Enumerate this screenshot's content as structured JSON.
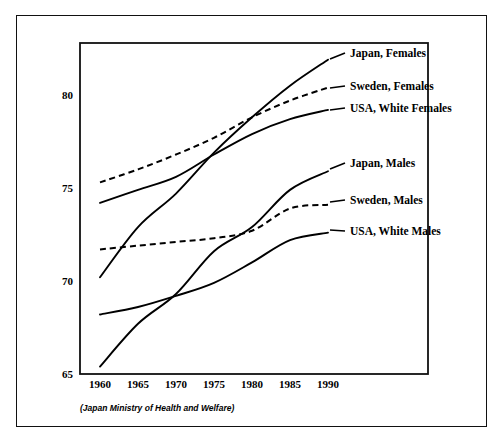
{
  "caption": "(Japan Ministry of Health and Welfare)",
  "axis": {
    "y_ticks": [
      "65",
      "70",
      "75",
      "80"
    ],
    "x_ticks": [
      "1960",
      "1965",
      "1970",
      "1975",
      "1980",
      "1985",
      "1990"
    ]
  },
  "labels": {
    "japan_females": "Japan, Females",
    "sweden_females": "Sweden, Females",
    "usa_white_females": "USA, White Females",
    "japan_males": "Japan, Males",
    "sweden_males": "Sweden, Males",
    "usa_white_males": "USA, White Males"
  },
  "chart_data": {
    "type": "line",
    "title": "",
    "xlabel": "",
    "ylabel": "",
    "xlim": [
      1960,
      1990
    ],
    "ylim": [
      65,
      82.5
    ],
    "grid": false,
    "legend_position": "right-inline-labels",
    "x": [
      1960,
      1965,
      1970,
      1975,
      1980,
      1985,
      1990
    ],
    "series": [
      {
        "name": "Japan, Females",
        "style": "solid",
        "color": "#000000",
        "values": [
          70.2,
          72.9,
          74.7,
          76.9,
          78.8,
          80.5,
          81.9
        ]
      },
      {
        "name": "Sweden, Females",
        "style": "dashed",
        "color": "#000000",
        "values": [
          75.3,
          76.0,
          76.8,
          77.7,
          78.8,
          79.7,
          80.4
        ]
      },
      {
        "name": "USA, White Females",
        "style": "solid",
        "color": "#000000",
        "values": [
          74.2,
          74.9,
          75.6,
          76.8,
          77.9,
          78.7,
          79.2
        ]
      },
      {
        "name": "Japan, Males",
        "style": "solid",
        "color": "#000000",
        "values": [
          65.4,
          67.7,
          69.3,
          71.6,
          72.9,
          74.9,
          75.9
        ]
      },
      {
        "name": "Sweden, Males",
        "style": "dashed",
        "color": "#000000",
        "values": [
          71.7,
          71.9,
          72.1,
          72.3,
          72.7,
          73.9,
          74.1
        ]
      },
      {
        "name": "USA, White Males",
        "style": "solid",
        "color": "#000000",
        "values": [
          68.2,
          68.6,
          69.2,
          69.9,
          71.0,
          72.2,
          72.6
        ]
      }
    ]
  }
}
